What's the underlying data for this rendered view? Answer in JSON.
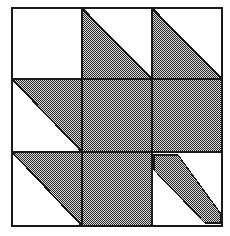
{
  "figure": {
    "type": "quilt-block-diagram",
    "width": 230,
    "height": 236,
    "background_color": "#ffffff"
  },
  "colors": {
    "line": "#1a1a1a",
    "fill_shaded": "#7a7a7a",
    "fill_plain": "#ffffff",
    "dither_dark": "#2e2e2e",
    "dither_light": "#d8d8d8"
  },
  "geometry": {
    "outer_left": 12,
    "outer_top": 8,
    "outer_right": 222,
    "outer_bottom": 226,
    "grid_x": [
      12,
      82,
      152,
      222
    ],
    "grid_y": [
      8,
      79,
      152,
      226
    ],
    "border_width": 1.6,
    "grid_line_width": 2.2
  },
  "grid": {
    "rows": 3,
    "cols": 3,
    "cells": [
      {
        "row": 0,
        "col": 0,
        "name": "cell-top-left",
        "pattern": "plain",
        "shaded": false
      },
      {
        "row": 0,
        "col": 1,
        "name": "cell-top-center",
        "pattern": "half-lower-left",
        "shaded": true
      },
      {
        "row": 0,
        "col": 2,
        "name": "cell-top-right",
        "pattern": "half-lower-left",
        "shaded": true
      },
      {
        "row": 1,
        "col": 0,
        "name": "cell-middle-left",
        "pattern": "half-upper-right",
        "shaded": true
      },
      {
        "row": 1,
        "col": 1,
        "name": "cell-center",
        "pattern": "full",
        "shaded": true
      },
      {
        "row": 1,
        "col": 2,
        "name": "cell-middle-right",
        "pattern": "full",
        "shaded": true
      },
      {
        "row": 2,
        "col": 0,
        "name": "cell-bottom-left",
        "pattern": "half-upper-right",
        "shaded": true
      },
      {
        "row": 2,
        "col": 1,
        "name": "cell-bottom-center",
        "pattern": "full",
        "shaded": true
      },
      {
        "row": 2,
        "col": 2,
        "name": "cell-bottom-right",
        "pattern": "diagonal-stem",
        "shaded": true
      }
    ]
  },
  "stem": {
    "name": "leaf-stem",
    "description": "diagonal band from upper-left to lower-right of bottom-right cell",
    "points": "155,156 178,156 219,213 219,221 206,221 155,171"
  },
  "labels": {
    "figure_caption": ""
  }
}
